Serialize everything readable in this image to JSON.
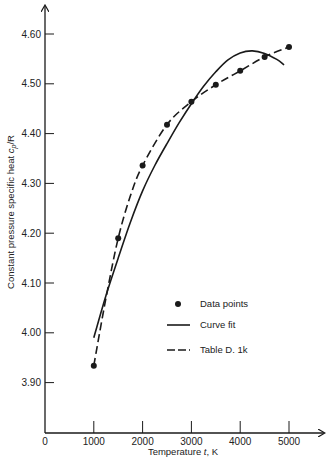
{
  "chart_data": {
    "type": "line",
    "title": "",
    "xlabel": "Temperature t, K",
    "ylabel": "Constant pressure specific heat c_p/R",
    "xlabel_parts": {
      "pre": "Temperature ",
      "var": "t",
      "post": ",  K"
    },
    "ylabel_parts": {
      "pre": "Constant pressure specific heat ",
      "var": "c",
      "sub": "p",
      "post": "/R"
    },
    "xlim": [
      0,
      5600
    ],
    "ylim": [
      3.8,
      4.65
    ],
    "x_ticks": [
      0,
      1000,
      2000,
      3000,
      4000,
      5000
    ],
    "x_tick_labels": [
      "0",
      "1000",
      "2000",
      "3000",
      "4000",
      "5000"
    ],
    "y_ticks": [
      3.9,
      4.0,
      4.1,
      4.2,
      4.3,
      4.4,
      4.5,
      4.6
    ],
    "y_tick_labels": [
      "3.90",
      "4.00",
      "4.10",
      "4.20",
      "4.30",
      "4.40",
      "4.50",
      "4.60"
    ],
    "grid": false,
    "legend_position": "center-right",
    "series": [
      {
        "name": "Data points",
        "style": "markers",
        "x": [
          1000,
          1500,
          2000,
          2500,
          3000,
          3500,
          4000,
          4500,
          5000
        ],
        "y": [
          3.934,
          4.19,
          4.336,
          4.418,
          4.464,
          4.498,
          4.526,
          4.554,
          4.574
        ]
      },
      {
        "name": "Curve fit",
        "style": "solid",
        "x": [
          1000,
          1250,
          1500,
          1750,
          2000,
          2250,
          2500,
          2750,
          3000,
          3250,
          3500,
          3750,
          4000,
          4250,
          4500,
          4750,
          4900
        ],
        "y": [
          3.99,
          4.075,
          4.15,
          4.222,
          4.285,
          4.336,
          4.38,
          4.422,
          4.46,
          4.495,
          4.524,
          4.548,
          4.562,
          4.566,
          4.561,
          4.549,
          4.538
        ]
      },
      {
        "name": "Table D. 1k",
        "style": "dashed",
        "x": [
          1000,
          1250,
          1500,
          1750,
          2000,
          2500,
          3000,
          3500,
          4000,
          4500,
          5000
        ],
        "y": [
          3.934,
          4.07,
          4.19,
          4.275,
          4.336,
          4.418,
          4.464,
          4.498,
          4.526,
          4.554,
          4.574
        ]
      }
    ]
  },
  "legend": {
    "items": [
      {
        "label": "Data points",
        "style": "markers"
      },
      {
        "label": "Curve fit",
        "style": "solid"
      },
      {
        "label": "Table D. 1k",
        "style": "dashed"
      }
    ]
  },
  "colors": {
    "ink": "#1a1a1a",
    "background": "#ffffff"
  }
}
